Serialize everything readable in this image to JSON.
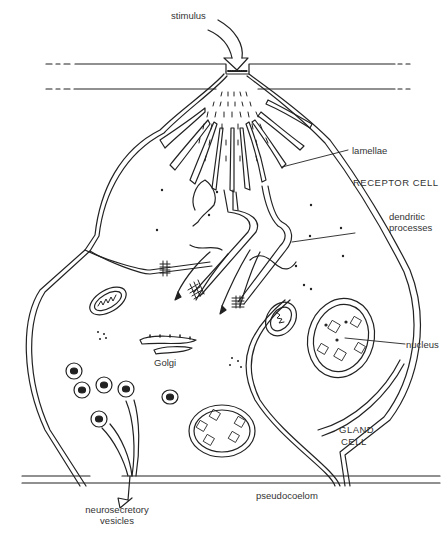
{
  "diagram": {
    "type": "biological cell diagram (neurosecretory receptor and gland cell)",
    "labels": {
      "stimulus": "stimulus",
      "lamellae": "lamellae",
      "receptor_cell": "RECEPTOR CELL",
      "dendritic_processes_1": "dendritic",
      "dendritic_processes_2": "processes",
      "nucleus": "nucleus",
      "golgi": "Golgi",
      "gland_cell_1": "GLAND",
      "gland_cell_2": "CELL",
      "pseudocoelom": "pseudocoelom",
      "neurosecretory_1": "neurosecretory",
      "neurosecretory_2": "vesicles"
    },
    "colors": {
      "line": "#222222",
      "background": "#ffffff"
    }
  }
}
